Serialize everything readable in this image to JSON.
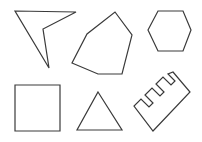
{
  "figure": {
    "width": 202,
    "height": 142,
    "background": "#ffffff",
    "stroke_color": "#3a3a3a",
    "stroke_width": 1.2
  },
  "shapes": [
    {
      "name": "arrowhead-quadrilateral",
      "type": "concave-quadrilateral",
      "points": "15,11 76,12 43,29 49,68"
    },
    {
      "name": "irregular-hexagon",
      "type": "irregular-polygon",
      "points": "115,12 132,35 122,74 98,74 72,63 87,34"
    },
    {
      "name": "regular-hexagon",
      "type": "hexagon",
      "points": "158,11 183,11 191,30 183,51 158,51 148,30"
    },
    {
      "name": "square",
      "type": "square",
      "points": "15,85 60,85 60,131 15,131"
    },
    {
      "name": "triangle",
      "type": "triangle",
      "points": "98,92 122,130 77,130"
    },
    {
      "name": "comb-shape",
      "type": "comb-polygon",
      "points": "173,72 190,92 153,131 134,106 141,99 149,107 153,103 145,95 152,88 160,96 164,92 156,84 163,77 171,85 175,81 168,74 173,72"
    }
  ]
}
